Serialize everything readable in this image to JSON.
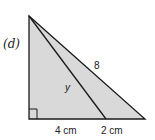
{
  "figure": {
    "part_label": "(d)",
    "colors": {
      "fill": "#d9d9d9",
      "stroke": "#1a1a1a",
      "background": "#ffffff"
    },
    "labels": {
      "hypotenuse": "8",
      "inner_segment": "y",
      "base_left": "4 cm",
      "base_right": "2 cm"
    },
    "right_angle_marker": true
  }
}
